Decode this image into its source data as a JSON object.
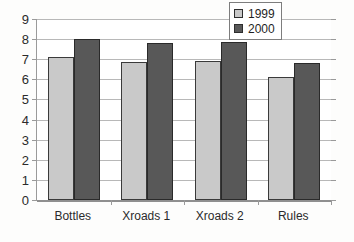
{
  "chart_data": {
    "type": "bar",
    "title": "",
    "subtitle": "",
    "xlabel": "",
    "ylabel": "",
    "categories": [
      "Bottles",
      "Xroads 1",
      "Xroads 2",
      "Rules"
    ],
    "series": [
      {
        "name": "1999",
        "color": "#c9c9c9",
        "values": [
          7.1,
          6.85,
          6.9,
          6.1
        ]
      },
      {
        "name": "2000",
        "color": "#585858",
        "values": [
          8.0,
          7.8,
          7.85,
          6.8
        ]
      }
    ],
    "ylim": [
      0,
      9
    ],
    "ytick_labels": [
      "0",
      "1",
      "2",
      "3",
      "4",
      "5",
      "6",
      "7",
      "8",
      "9"
    ],
    "ytick_values": [
      0,
      1,
      2,
      3,
      4,
      5,
      6,
      7,
      8,
      9
    ],
    "grid": true,
    "grid_axis": "y",
    "legend_position": "top-right",
    "legend_entries": [
      "1999",
      "2000"
    ],
    "bar_outline_color": "#3a3a3a",
    "axis_color": "#9a9a9a"
  },
  "artifacts": {
    "top_line_1": "",
    "top_line_2": "",
    "bottom_line": ""
  }
}
